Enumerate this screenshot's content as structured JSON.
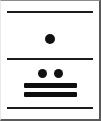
{
  "card": {
    "title": "Mayan numeral glyph card",
    "background_color": "#ffffff",
    "frame_color": "#5a5a5a",
    "ink_color": "#111111",
    "width": 101,
    "height": 121
  },
  "separators": [
    {
      "name": "top-rule",
      "label": "top separator rule"
    },
    {
      "name": "middle-rule",
      "label": "middle separator rule"
    },
    {
      "name": "bottom-rule",
      "label": "bottom separator rule"
    }
  ],
  "registers": [
    {
      "name": "upper-register",
      "label": "Upper register",
      "dots": 1,
      "bars": 0,
      "value": "1"
    },
    {
      "name": "lower-register",
      "label": "Lower register",
      "dots": 2,
      "bars": 2,
      "value": "12"
    }
  ],
  "marks": {
    "dot_upper_1": "dot",
    "dot_lower_1": "dot",
    "dot_lower_2": "dot",
    "bar_lower_1": "bar",
    "bar_lower_2": "bar"
  }
}
